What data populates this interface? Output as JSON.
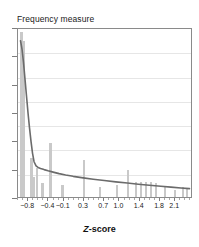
{
  "chart_data": {
    "type": "bar",
    "title": "Frequency measure",
    "xlabel": "Z-score",
    "xlabel_parts": {
      "italic": "Z",
      "rest": "-score"
    },
    "ylabel": "",
    "grid": true,
    "gridlines": 6,
    "legend": "none",
    "xlim": [
      -1.0,
      2.45
    ],
    "ylim": [
      0,
      100
    ],
    "xtick_labels": [
      "−0.8",
      "−0.4",
      "−0.1",
      "0.3",
      "0.7",
      "1.0",
      "1.4",
      "1.8",
      "2.1"
    ],
    "xtick_values": [
      -0.8,
      -0.4,
      -0.1,
      0.3,
      0.7,
      1.0,
      1.4,
      1.8,
      2.1
    ],
    "ytick_count": 7,
    "ytick_labels": [],
    "bars": {
      "x": [
        -0.93,
        -0.88,
        -0.73,
        -0.68,
        -0.62,
        -0.52,
        -0.36,
        -0.12,
        0.3,
        0.62,
        0.95,
        1.17,
        1.33,
        1.42,
        1.52,
        1.62,
        1.72,
        1.9,
        2.1,
        2.25,
        2.33
      ],
      "values": [
        97,
        92,
        23,
        12,
        17,
        8,
        32,
        7,
        22,
        6,
        7,
        16,
        9,
        9,
        9,
        9,
        8,
        6,
        4,
        6,
        5
      ]
    },
    "curve": {
      "name": "fitted frequency curve",
      "x": [
        -0.95,
        -0.92,
        -0.89,
        -0.86,
        -0.83,
        -0.8,
        -0.77,
        -0.74,
        -0.71,
        -0.68,
        -0.64,
        -0.6,
        -0.55,
        -0.48,
        -0.4,
        -0.3,
        -0.18,
        -0.05,
        0.1,
        0.3,
        0.5,
        0.72,
        0.95,
        1.18,
        1.4,
        1.62,
        1.85,
        2.05,
        2.25,
        2.42
      ],
      "y": [
        93,
        88,
        80,
        70,
        60,
        50,
        41,
        33,
        26,
        21,
        18.5,
        17.6,
        17.0,
        16.3,
        15.6,
        14.8,
        13.9,
        13.1,
        12.3,
        11.4,
        10.6,
        9.8,
        9.0,
        8.3,
        7.6,
        7.0,
        6.4,
        5.9,
        5.4,
        5.0
      ]
    },
    "colors": {
      "bar": "#c9c9c9",
      "curve": "#6b6b6b",
      "grid": "#e6e6e6",
      "frame": "#8a8a8a",
      "text": "#1a1a1a"
    }
  }
}
